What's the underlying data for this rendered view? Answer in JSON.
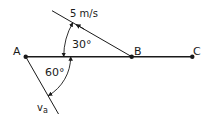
{
  "diagram": {
    "points": [
      {
        "id": "A",
        "label": "A",
        "x": 25.7,
        "y": 56.7
      },
      {
        "id": "B",
        "label": "B",
        "x": 131.7,
        "y": 56.7
      },
      {
        "id": "C",
        "label": "C",
        "x": 192.3,
        "y": 56.7
      }
    ],
    "baseline": {
      "from": "A",
      "to": "C"
    },
    "velocity_B": {
      "label": "5 m/s",
      "angle_deg": 30,
      "angle_label": "30°"
    },
    "velocity_A": {
      "label": "v",
      "subscript": "a",
      "angle_deg": 60,
      "angle_label": "60°"
    },
    "colors": {
      "stroke": "#1a1a1a",
      "background": "#ffffff"
    }
  }
}
